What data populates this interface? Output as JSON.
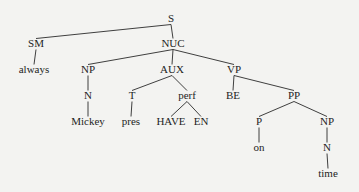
{
  "diagram": {
    "type": "syntax-tree",
    "nodes": [
      {
        "id": "S",
        "label": "S"
      },
      {
        "id": "SM",
        "label": "SM",
        "parent": "S"
      },
      {
        "id": "always",
        "label": "always",
        "parent": "SM"
      },
      {
        "id": "NUC",
        "label": "NUC",
        "parent": "S"
      },
      {
        "id": "NP1",
        "label": "NP",
        "parent": "NUC"
      },
      {
        "id": "N1",
        "label": "N",
        "parent": "NP1"
      },
      {
        "id": "Mickey",
        "label": "Mickey",
        "parent": "N1"
      },
      {
        "id": "AUX",
        "label": "AUX",
        "parent": "NUC"
      },
      {
        "id": "T",
        "label": "T",
        "parent": "AUX"
      },
      {
        "id": "pres",
        "label": "pres",
        "parent": "T"
      },
      {
        "id": "perf",
        "label": "perf",
        "parent": "AUX"
      },
      {
        "id": "HAVE",
        "label": "HAVE",
        "parent": "perf"
      },
      {
        "id": "EN",
        "label": "EN",
        "parent": "perf"
      },
      {
        "id": "VP",
        "label": "VP",
        "parent": "NUC"
      },
      {
        "id": "BE",
        "label": "BE",
        "parent": "VP"
      },
      {
        "id": "PP",
        "label": "PP",
        "parent": "VP"
      },
      {
        "id": "P",
        "label": "P",
        "parent": "PP"
      },
      {
        "id": "on",
        "label": "on",
        "parent": "P"
      },
      {
        "id": "NP2",
        "label": "NP",
        "parent": "PP"
      },
      {
        "id": "N2",
        "label": "N",
        "parent": "NP2"
      },
      {
        "id": "time",
        "label": "time",
        "parent": "N2"
      }
    ]
  }
}
